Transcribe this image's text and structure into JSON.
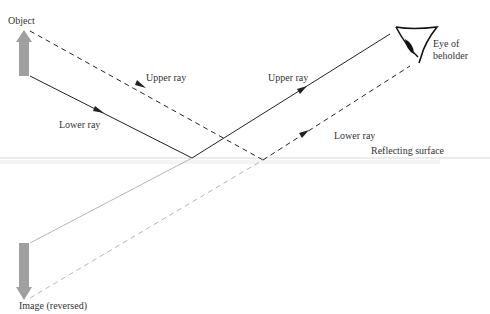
{
  "labels": {
    "object": "Object",
    "upper_ray_incident": "Upper ray",
    "lower_ray_incident": "Lower ray",
    "upper_ray_reflected": "Upper ray",
    "lower_ray_reflected": "Lower ray",
    "eye_line1": "Eye of",
    "eye_line2": "beholder",
    "surface": "Reflecting surface",
    "image": "Image (reversed)"
  },
  "colors": {
    "solid_ray": "#222222",
    "dashed_ray": "#222222",
    "virtual_ray": "#b0b0b0",
    "arrow_fill": "#a0a0a0",
    "surface": "#e6e6e6"
  }
}
